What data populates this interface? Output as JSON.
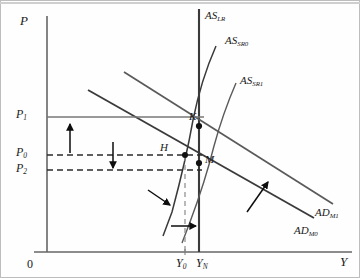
{
  "figure": {
    "type": "ad-as-diagram",
    "axes": {
      "y_axis_label": "P",
      "x_axis_label": "Y",
      "origin_label": "0"
    },
    "price_ticks": [
      {
        "id": "P1",
        "base": "P",
        "sub": "1",
        "y": 117,
        "style": "solid"
      },
      {
        "id": "P0",
        "base": "P",
        "sub": "0",
        "y": 155,
        "style": "dashed"
      },
      {
        "id": "P2",
        "base": "P",
        "sub": "2",
        "y": 170,
        "style": "dashed"
      }
    ],
    "output_ticks": [
      {
        "id": "Y0",
        "base": "Y",
        "sub": "0",
        "x": 185,
        "style": "dashed"
      },
      {
        "id": "YN",
        "base": "Y",
        "sub": "N",
        "x": 199,
        "style": "solid"
      }
    ],
    "curves": [
      {
        "id": "AS_LR",
        "base": "AS",
        "sub": "LR",
        "kind": "vertical-long-run-supply"
      },
      {
        "id": "AS_SR0",
        "base": "AS",
        "sub": "SR0",
        "kind": "short-run-supply"
      },
      {
        "id": "AS_SR1",
        "base": "AS",
        "sub": "SR1",
        "kind": "short-run-supply"
      },
      {
        "id": "AD_M0",
        "base": "AD",
        "sub": "M0",
        "kind": "aggregate-demand"
      },
      {
        "id": "AD_M1",
        "base": "AD",
        "sub": "M1",
        "kind": "aggregate-demand"
      }
    ],
    "points": [
      {
        "id": "K",
        "label": "K",
        "x": 199,
        "y": 126
      },
      {
        "id": "H",
        "label": "H",
        "x": 185,
        "y": 155
      },
      {
        "id": "M",
        "label": "M",
        "x": 199,
        "y": 163
      }
    ],
    "arrows": [
      {
        "id": "price-rise",
        "direction": "up",
        "meaning": "P0 to P1"
      },
      {
        "id": "price-fall",
        "direction": "down",
        "meaning": "P0 to P2"
      },
      {
        "id": "as-shift",
        "direction": "down-right",
        "meaning": "AS_SR0 to AS_SR1"
      },
      {
        "id": "ad-shift",
        "direction": "up-right",
        "meaning": "AD_M0 to AD_M1"
      },
      {
        "id": "output-rise",
        "direction": "right",
        "meaning": "Y0 to YN"
      }
    ],
    "colors": {
      "ink": "#1a1a1a",
      "curve": "#3a3a3a",
      "axis": "#555555",
      "background": "#fefefe",
      "border": "#b9b9b9"
    }
  }
}
